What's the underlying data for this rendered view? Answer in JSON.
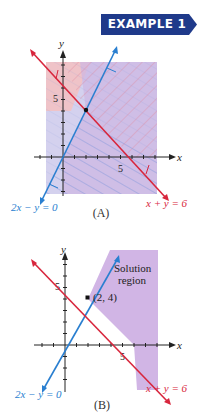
{
  "banner": {
    "label": "EXAMPLE 1",
    "color": "#1f3a8a"
  },
  "graph_a": {
    "caption": "(A)",
    "axis_x_label": "x",
    "axis_y_label": "y",
    "tick_x_5": "5",
    "tick_y_5": "5",
    "line_red_label": "x + y = 6",
    "line_blue_label": "2x − y = 0",
    "red_color": "#d8263d",
    "blue_color": "#2a7fd0"
  },
  "graph_b": {
    "caption": "(B)",
    "axis_x_label": "x",
    "axis_y_label": "y",
    "tick_x_5": "5",
    "tick_y_5": "5",
    "region_label_1": "Solution",
    "region_label_2": "region",
    "point_label": "(2, 4)",
    "line_red_label": "x + y = 6",
    "line_blue_label": "2x − y = 0",
    "region_color": "#c9a8e0"
  }
}
